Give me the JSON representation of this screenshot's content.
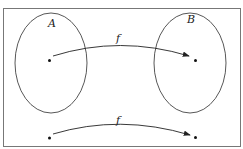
{
  "diagram": {
    "type": "function-mapping",
    "sets": [
      {
        "name": "A",
        "label": "A"
      },
      {
        "name": "B",
        "label": "B"
      }
    ],
    "arrows": [
      {
        "label": "f",
        "from": "point in A",
        "to": "point in B"
      },
      {
        "label": "f",
        "from": "point below A",
        "to": "point below B"
      }
    ],
    "colors": {
      "stroke": "#333333",
      "frame": "#666666",
      "background": "#ffffff"
    }
  }
}
